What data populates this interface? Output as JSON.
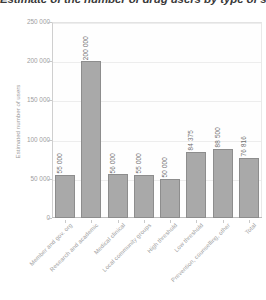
{
  "chart_data": {
    "type": "bar",
    "title": "Estimate of the number of drug users by type of service",
    "subtitle": "",
    "xlabel": "",
    "ylabel": "Estimated number of users",
    "categories": [
      "Member and gov. org",
      "Research and academic",
      "Medical clinical",
      "Local community groups",
      "High threshold",
      "Low threshold",
      "Prevention, counselling, other",
      "Total"
    ],
    "values": [
      55000,
      200000,
      56000,
      55000,
      50000,
      84375,
      88500,
      76816
    ],
    "value_labels": [
      "55 000",
      "200 000",
      "56 000",
      "55 000",
      "50 000",
      "84 375",
      "88 500",
      "76 816"
    ],
    "ylim": [
      0,
      250000
    ],
    "ytick_values": [
      0,
      50000,
      100000,
      150000,
      200000,
      250000
    ],
    "ytick_labels": [
      "0",
      "50 000",
      "100 000",
      "150 000",
      "200 000",
      "250 000"
    ],
    "grid": true,
    "legend": false,
    "legend_position": "none",
    "bar_color": "#a9a9a9",
    "bar_edge_color": "#8d8d8d",
    "grid_color": "#ededed",
    "axis_color": "#bdbdbd",
    "text_color": "#9e9e9e",
    "title_color": "#3a3a3a"
  }
}
